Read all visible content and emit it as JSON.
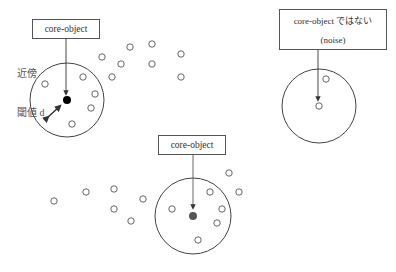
{
  "diagram": {
    "boxes": [
      {
        "id": "core1",
        "lines": [
          "core-object"
        ],
        "x": 32,
        "y": 19,
        "w": 68,
        "h": 20
      },
      {
        "id": "noise",
        "lines": [
          "core-object ではない",
          "(noise)"
        ],
        "x": 279,
        "y": 9,
        "w": 108,
        "h": 41
      },
      {
        "id": "core2",
        "lines": [
          "core-object"
        ],
        "x": 158,
        "y": 135,
        "w": 68,
        "h": 20
      }
    ],
    "labels": {
      "neighborhood": "近傍",
      "threshold": "閾値 d"
    },
    "neighborhoods": [
      {
        "id": "n1",
        "cx": 67,
        "cy": 100,
        "r": 37,
        "center_type": "core",
        "center_color": "#000000"
      },
      {
        "id": "n2",
        "cx": 319,
        "cy": 106,
        "r": 37,
        "center_type": "noise",
        "center_color": "#ffffff"
      },
      {
        "id": "n3",
        "cx": 193,
        "cy": 216,
        "r": 38,
        "center_type": "core",
        "center_color": "#555555"
      }
    ],
    "points": [
      {
        "x": 45,
        "y": 84
      },
      {
        "x": 83,
        "y": 77
      },
      {
        "x": 95,
        "y": 94
      },
      {
        "x": 91,
        "y": 108
      },
      {
        "x": 72,
        "y": 124
      },
      {
        "x": 102,
        "y": 57
      },
      {
        "x": 130,
        "y": 47
      },
      {
        "x": 152,
        "y": 44
      },
      {
        "x": 121,
        "y": 64
      },
      {
        "x": 152,
        "y": 64
      },
      {
        "x": 181,
        "y": 54
      },
      {
        "x": 112,
        "y": 77
      },
      {
        "x": 181,
        "y": 77
      },
      {
        "x": 326,
        "y": 79
      },
      {
        "x": 54,
        "y": 201
      },
      {
        "x": 86,
        "y": 192
      },
      {
        "x": 114,
        "y": 189
      },
      {
        "x": 114,
        "y": 209
      },
      {
        "x": 143,
        "y": 199
      },
      {
        "x": 131,
        "y": 221
      },
      {
        "x": 172,
        "y": 209
      },
      {
        "x": 210,
        "y": 192
      },
      {
        "x": 222,
        "y": 209
      },
      {
        "x": 217,
        "y": 223
      },
      {
        "x": 198,
        "y": 240
      },
      {
        "x": 229,
        "y": 173
      },
      {
        "x": 239,
        "y": 192
      }
    ],
    "colors": {
      "stroke": "#444444",
      "point_stroke": "#555555",
      "core_dot": "#000000",
      "core_dot_gray": "#555555"
    }
  }
}
